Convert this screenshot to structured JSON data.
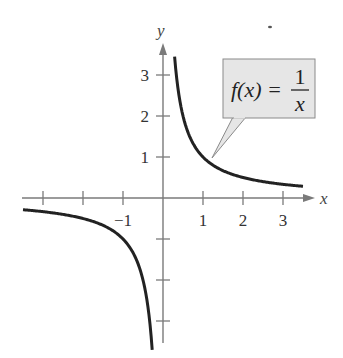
{
  "chart_data": {
    "type": "line",
    "title": "",
    "function_label": "f(x) = 1/x",
    "callout": {
      "lhs": "f(x) =",
      "numerator": "1",
      "denominator": "x"
    },
    "xlabel": "x",
    "ylabel": "y",
    "xlim": [
      -3.5,
      3.5
    ],
    "ylim": [
      -3.5,
      3.5
    ],
    "grid": false,
    "x_ticks": [
      -3,
      -2,
      -1,
      1,
      2,
      3
    ],
    "x_tick_labels": [
      "",
      "",
      "−1",
      "1",
      "2",
      "3"
    ],
    "y_ticks": [
      -3,
      -2,
      -1,
      1,
      2,
      3
    ],
    "y_tick_labels": [
      "",
      "",
      "",
      "1",
      "2",
      "3"
    ],
    "series": [
      {
        "name": "f(x) = 1/x (x<0 branch)",
        "x": [
          -3.5,
          -3,
          -2.5,
          -2,
          -1.5,
          -1,
          -0.8,
          -0.6,
          -0.5,
          -0.4,
          -0.35,
          -0.3
        ],
        "y": [
          -0.286,
          -0.333,
          -0.4,
          -0.5,
          -0.667,
          -1,
          -1.25,
          -1.667,
          -2,
          -2.5,
          -2.857,
          -3.333
        ]
      },
      {
        "name": "f(x) = 1/x (x>0 branch)",
        "x": [
          0.29,
          0.35,
          0.4,
          0.5,
          0.6,
          0.8,
          1,
          1.5,
          2,
          2.5,
          3,
          3.5
        ],
        "y": [
          3.448,
          2.857,
          2.5,
          2,
          1.667,
          1.25,
          1,
          0.667,
          0.5,
          0.4,
          0.333,
          0.286
        ]
      }
    ],
    "colors": {
      "curve": "#222222",
      "axis": "#7a7a7a",
      "callout_fill": "#e6e6e6",
      "callout_stroke": "#8a8a8a"
    }
  }
}
